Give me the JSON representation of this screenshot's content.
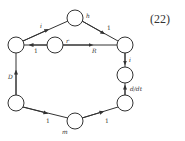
{
  "equation_number": "(22)",
  "colors": {
    "stroke": "#333333",
    "background": "#ffffff"
  },
  "nodes": [
    {
      "id": "top",
      "x": 75,
      "y": 18,
      "label": "h"
    },
    {
      "id": "left_top",
      "x": 16,
      "y": 45,
      "label": ""
    },
    {
      "id": "mid",
      "x": 55,
      "y": 45,
      "label": "r"
    },
    {
      "id": "right_top",
      "x": 125,
      "y": 45,
      "label": ""
    },
    {
      "id": "right_mid",
      "x": 125,
      "y": 75,
      "label": ""
    },
    {
      "id": "right_bot",
      "x": 125,
      "y": 103,
      "label": ""
    },
    {
      "id": "left_bot",
      "x": 16,
      "y": 103,
      "label": ""
    },
    {
      "id": "bottom",
      "x": 75,
      "y": 121,
      "label": "m"
    }
  ],
  "edges": [
    {
      "from": "left_top",
      "to": "top",
      "label": "i"
    },
    {
      "from": "top",
      "to": "right_top",
      "label": "1"
    },
    {
      "from": "mid",
      "to": "left_top",
      "label": "1"
    },
    {
      "from": "mid",
      "to": "right_top",
      "label": "R"
    },
    {
      "from": "right_top",
      "to": "right_mid",
      "label": "i"
    },
    {
      "from": "right_bot",
      "to": "right_mid",
      "label": "d/dt"
    },
    {
      "from": "left_bot",
      "to": "left_top",
      "label": "D"
    },
    {
      "from": "left_bot",
      "to": "bottom",
      "label": "1"
    },
    {
      "from": "bottom",
      "to": "right_bot",
      "label": "1"
    }
  ],
  "labels": {
    "node_h": "h",
    "node_r": "r",
    "node_m": "m",
    "edge_top_left": "i",
    "edge_top_right": "1",
    "edge_mid_left": "1",
    "edge_mid_right": "R",
    "edge_right_upper": "i",
    "edge_right_lower": "d/dt",
    "edge_left": "D",
    "edge_bottom_left": "1",
    "edge_bottom_right": "1"
  }
}
